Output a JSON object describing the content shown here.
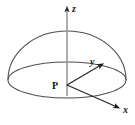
{
  "figure": {
    "background_color": "#ffffff",
    "stroke_color": "#4a4a4a",
    "axis_color": "#8c8c8c",
    "ray_color": "#2b2b2b",
    "label_color": "#1a1a1a"
  },
  "labels": {
    "z_axis": "z",
    "y_axis": "y",
    "x_axis": "x",
    "origin_point": "P"
  },
  "geometry": {
    "shape": "hemisphere",
    "dome_apex": {
      "x": 67,
      "y": 31
    },
    "equator_ellipse": {
      "center_x": 67,
      "center_y": 80,
      "radius_x": 59,
      "radius_y": 18
    },
    "origin": {
      "x": 67,
      "y": 85
    },
    "z_axis_tip": {
      "x": 67,
      "y": 5
    },
    "y_axis_tip": {
      "x": 104,
      "y": 64
    },
    "x_axis_tip": {
      "x": 120,
      "y": 108
    }
  },
  "icons": {
    "arrowhead": "arrowhead-icon"
  }
}
